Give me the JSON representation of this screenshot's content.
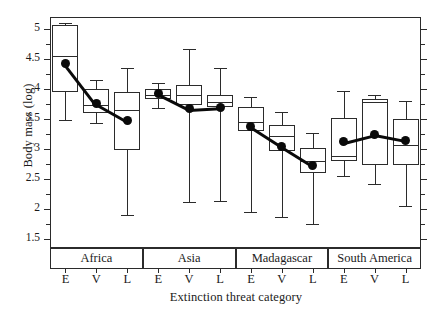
{
  "chart_data": {
    "type": "box",
    "title": "",
    "xlabel": "Extinction threat category",
    "ylabel": "Body mass (log)",
    "ylim": [
      1.35,
      5.2
    ],
    "yticks": [
      1.5,
      2,
      2.5,
      3,
      3.5,
      4,
      4.5,
      5
    ],
    "ytick_labels": [
      "1.5",
      "2",
      "2.5",
      "3",
      "3.5",
      "4",
      "4.5",
      "5"
    ],
    "yminor_ticks": [
      1.75,
      2.25,
      2.75,
      3.25,
      3.75,
      4.25,
      4.75
    ],
    "grid": false,
    "legend": null,
    "group_label_band": true,
    "groups": [
      "Africa",
      "Asia",
      "Madagascar",
      "South America"
    ],
    "categories": [
      "E",
      "V",
      "L"
    ],
    "category_names": [
      "Endangered",
      "Vulnerable",
      "Lower risk"
    ],
    "boxes": [
      {
        "group": "Africa",
        "category": "E",
        "whisker_low": 3.48,
        "q1": 3.95,
        "median": 4.55,
        "q3": 5.07,
        "whisker_high": 5.1,
        "mean": 4.43
      },
      {
        "group": "Africa",
        "category": "V",
        "whisker_low": 3.44,
        "q1": 3.6,
        "median": 3.73,
        "q3": 4.0,
        "whisker_high": 4.15,
        "mean": 3.76
      },
      {
        "group": "Africa",
        "category": "L",
        "whisker_low": 1.9,
        "q1": 2.98,
        "median": 3.65,
        "q3": 3.95,
        "whisker_high": 4.35,
        "mean": 3.47
      },
      {
        "group": "Asia",
        "category": "E",
        "whisker_low": 3.68,
        "q1": 3.83,
        "median": 3.9,
        "q3": 4.0,
        "whisker_high": 4.1,
        "mean": 3.93
      },
      {
        "group": "Asia",
        "category": "V",
        "whisker_low": 2.12,
        "q1": 3.73,
        "median": 3.9,
        "q3": 4.07,
        "whisker_high": 4.67,
        "mean": 3.67
      },
      {
        "group": "Asia",
        "category": "L",
        "whisker_low": 2.13,
        "q1": 3.7,
        "median": 3.78,
        "q3": 3.9,
        "whisker_high": 4.35,
        "mean": 3.7
      },
      {
        "group": "Madagascar",
        "category": "E",
        "whisker_low": 1.95,
        "q1": 3.3,
        "median": 3.45,
        "q3": 3.7,
        "whisker_high": 3.87,
        "mean": 3.38
      },
      {
        "group": "Madagascar",
        "category": "V",
        "whisker_low": 1.87,
        "q1": 2.97,
        "median": 3.22,
        "q3": 3.4,
        "whisker_high": 3.62,
        "mean": 3.05
      },
      {
        "group": "Madagascar",
        "category": "L",
        "whisker_low": 1.75,
        "q1": 2.6,
        "median": 2.8,
        "q3": 3.02,
        "whisker_high": 3.27,
        "mean": 2.73
      },
      {
        "group": "South America",
        "category": "E",
        "whisker_low": 2.55,
        "q1": 2.8,
        "median": 2.88,
        "q3": 3.52,
        "whisker_high": 3.97,
        "mean": 3.12
      },
      {
        "group": "South America",
        "category": "V",
        "whisker_low": 2.42,
        "q1": 2.73,
        "median": 3.78,
        "q3": 3.83,
        "whisker_high": 3.9,
        "mean": 3.25
      },
      {
        "group": "South America",
        "category": "L",
        "whisker_low": 2.05,
        "q1": 2.73,
        "median": 3.07,
        "q3": 3.5,
        "whisker_high": 3.8,
        "mean": 3.15
      }
    ],
    "mean_series": [
      {
        "group": "Africa",
        "values": [
          4.43,
          3.76,
          3.47
        ]
      },
      {
        "group": "Asia",
        "values": [
          3.93,
          3.67,
          3.7
        ]
      },
      {
        "group": "Madagascar",
        "values": [
          3.38,
          3.05,
          2.73
        ]
      },
      {
        "group": "South America",
        "values": [
          3.12,
          3.25,
          3.15
        ]
      }
    ],
    "colors": {
      "axis": "#2b2b2b",
      "box_fill": "#ffffff",
      "box_edge": "#2b2b2b",
      "mean_marker": "#0a0a0a",
      "background": "#ffffff"
    }
  }
}
